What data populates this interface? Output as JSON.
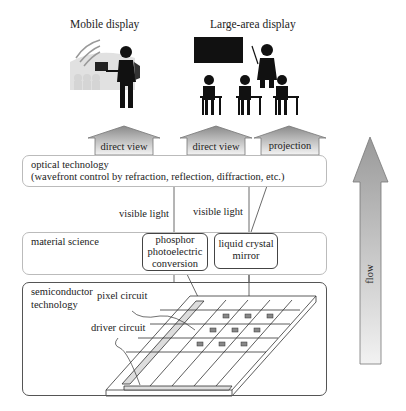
{
  "headings": {
    "mobile": "Mobile display",
    "large": "Large-area display"
  },
  "outputs": [
    {
      "label": "direct view"
    },
    {
      "label": "direct view"
    },
    {
      "label": "projection"
    }
  ],
  "layers": {
    "optical": {
      "title": "optical technology",
      "subtitle": "(wavefront control by refraction, reflection, diffraction, etc.)"
    },
    "material": {
      "title": "material science",
      "boxes": [
        {
          "lines": [
            "phosphor",
            "photoelectric",
            "conversion"
          ]
        },
        {
          "lines": [
            "liquid crystal",
            "mirror"
          ]
        }
      ]
    },
    "semiconductor": {
      "title_line1": "semiconductor",
      "title_line2": "technology",
      "labels": {
        "pixel": "pixel circuit",
        "driver": "driver circuit"
      }
    }
  },
  "light_labels": [
    "visible light",
    "visible light"
  ],
  "flow_label": "flow",
  "colors": {
    "ink": "#222222",
    "border_light": "#bbbbbb",
    "arrow_grad_top": "#9a9a9a",
    "arrow_grad_bottom": "#f2f2f2"
  }
}
